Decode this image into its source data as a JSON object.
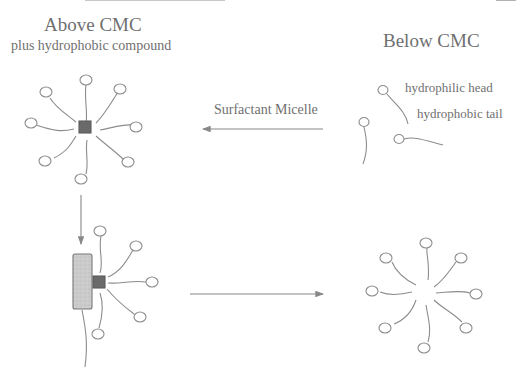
{
  "diagram": {
    "colors": {
      "stroke": "#8c8c8c",
      "core": "#6a6a6a",
      "compound_fill": "#c8c8c8",
      "text": "#707070"
    },
    "above": {
      "title": "Above CMC",
      "subtitle": "plus hydrophobic compound"
    },
    "below": {
      "title": "Below CMC"
    },
    "arrow_label": "Surfactant Micelle",
    "legend": {
      "head_label": "hydrophilic head",
      "tail_label": "hydrophobic tail"
    },
    "nodes": [
      {
        "id": "micelle-with-core",
        "position": "top-left",
        "surfactants": 8,
        "core": "hydrophobic compound (dark square)"
      },
      {
        "id": "free-surfactants",
        "position": "top-right",
        "surfactants": 3
      },
      {
        "id": "compound-bound-micelle",
        "position": "bottom-left",
        "surfactants": 6,
        "compound": "grey rectangle"
      },
      {
        "id": "empty-micelle",
        "position": "bottom-right",
        "surfactants": 8
      }
    ],
    "edges": [
      {
        "from": "free-surfactants",
        "to": "micelle-with-core",
        "label": "Surfactant Micelle",
        "direction": "left"
      },
      {
        "from": "micelle-with-core",
        "to": "compound-bound-micelle",
        "direction": "down"
      },
      {
        "from": "compound-bound-micelle",
        "to": "empty-micelle",
        "direction": "right"
      }
    ]
  }
}
